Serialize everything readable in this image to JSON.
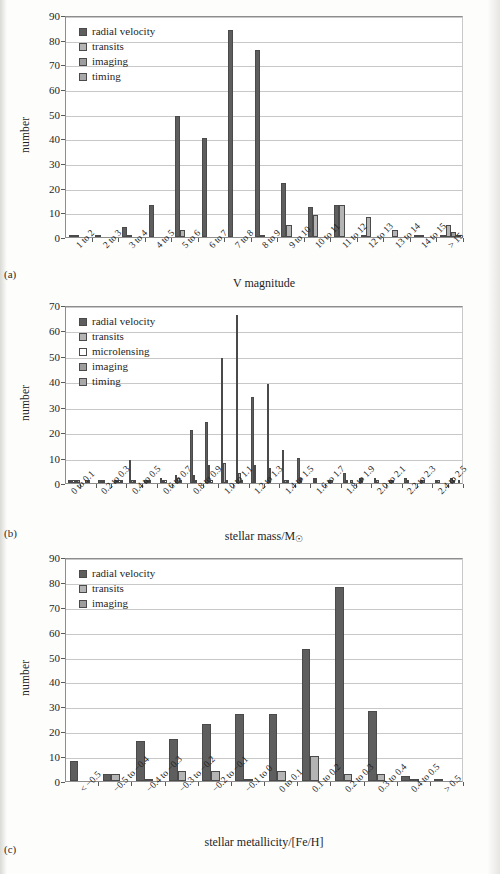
{
  "figure": {
    "panel_tags": [
      "(a)",
      "(b)",
      "(c)"
    ],
    "series_colors": {
      "radial velocity": "#5e5e5e",
      "transits": "#b4b4b4",
      "microlensing": "#ffffff",
      "imaging": "#9d9d9d",
      "timing": "#a8a8a8"
    }
  },
  "chart_data": [
    {
      "type": "bar",
      "panel": "(a)",
      "title": "",
      "xlabel": "V magnitude",
      "ylabel": "number",
      "ylim": [
        0,
        90
      ],
      "yticks": [
        0,
        10,
        20,
        30,
        40,
        50,
        60,
        70,
        80,
        90
      ],
      "grid": true,
      "legend_position": "top-left",
      "categories": [
        "1 to 2",
        "2 to 3",
        "3 to 4",
        "4 to 5",
        "5 to 6",
        "6 to 7",
        "7 to 8",
        "8 to 9",
        "9 to 10",
        "10 to 11",
        "11 to 12",
        "12 to 13",
        "13 to 14",
        "14 to 15",
        "> 15"
      ],
      "series": [
        {
          "name": "radial velocity",
          "values": [
            1,
            1,
            4,
            13,
            49,
            40,
            84,
            76,
            22,
            12,
            13,
            1,
            0,
            1,
            1
          ]
        },
        {
          "name": "transits",
          "values": [
            1,
            0,
            1,
            0,
            3,
            0,
            0,
            1,
            5,
            9,
            13,
            8,
            3,
            1,
            5
          ]
        },
        {
          "name": "imaging",
          "values": [
            0,
            0,
            0,
            0,
            0,
            0,
            0,
            0,
            0,
            0,
            0,
            0,
            0,
            0,
            2
          ]
        },
        {
          "name": "timing",
          "values": [
            0,
            0,
            0,
            0,
            0,
            0,
            0,
            0,
            0,
            0,
            0,
            0,
            0,
            0,
            1
          ]
        }
      ]
    },
    {
      "type": "bar",
      "panel": "(b)",
      "title": "",
      "xlabel": "stellar mass/M☉",
      "ylabel": "number",
      "ylim": [
        0,
        70
      ],
      "yticks": [
        0,
        10,
        20,
        30,
        40,
        50,
        60,
        70
      ],
      "grid": true,
      "legend_position": "top-left",
      "categories": [
        "0 to 0.1",
        "0.2 to 0.3",
        "0.4 to 0.5",
        "0.6 to 0.7",
        "0.8 to 0.9",
        "1.0 to 1.1",
        "1.2 to 1.3",
        "1.4 to 1.5",
        "1.6 to 1.7",
        "1.8 to 1.9",
        "2.0 to 2.1",
        "2.2 to 2.3",
        "2.4 to 2.5",
        "> 2.5"
      ],
      "bins": [
        "0 to 0.1",
        "0.1 to 0.2",
        "0.2 to 0.3",
        "0.3 to 0.4",
        "0.4 to 0.5",
        "0.5 to 0.6",
        "0.6 to 0.7",
        "0.7 to 0.8",
        "0.8 to 0.9",
        "0.9 to 1.0",
        "1.0 to 1.1",
        "1.1 to 1.2",
        "1.2 to 1.3",
        "1.3 to 1.4",
        "1.4 to 1.5",
        "1.5 to 1.6",
        "1.6 to 1.7",
        "1.7 to 1.8",
        "1.8 to 1.9",
        "1.9 to 2.0",
        "2.0 to 2.1",
        "2.1 to 2.2",
        "2.2 to 2.3",
        "2.3 to 2.4",
        "2.4 to 2.5",
        "> 2.5"
      ],
      "series": [
        {
          "name": "radial velocity",
          "values": [
            1,
            1,
            1,
            1,
            9,
            1,
            3,
            2,
            21,
            24,
            49,
            66,
            34,
            39,
            13,
            14,
            10,
            1,
            2,
            3,
            1,
            1,
            4,
            1,
            2,
            2,
            2,
            1,
            2,
            2,
            1,
            2
          ]
        },
        {
          "name": "transits",
          "values": [
            1,
            0,
            1,
            1,
            1,
            1,
            1,
            1,
            3,
            7,
            8,
            3,
            4,
            7,
            6,
            1,
            2,
            3,
            2,
            1,
            1,
            2,
            1,
            2,
            1,
            1,
            1,
            1,
            1,
            1,
            1,
            2
          ]
        },
        {
          "name": "microlensing",
          "values": [
            1,
            1,
            1,
            1,
            1,
            1,
            1,
            1,
            1,
            0,
            1,
            1,
            0,
            0,
            1,
            1,
            0,
            0,
            0,
            0,
            0,
            0,
            0,
            0,
            0,
            0,
            0,
            0,
            0,
            0,
            0,
            0
          ]
        },
        {
          "name": "imaging",
          "values": [
            1,
            0,
            0,
            1,
            0,
            1,
            0,
            0,
            0,
            0,
            0,
            0,
            0,
            0,
            0,
            0,
            1,
            0,
            0,
            1,
            0,
            0,
            0,
            0,
            0,
            0,
            0,
            0,
            0,
            0,
            0,
            1
          ]
        },
        {
          "name": "timing",
          "values": [
            1,
            0,
            0,
            0,
            0,
            0,
            0,
            0,
            0,
            0,
            0,
            0,
            0,
            0,
            0,
            0,
            0,
            0,
            0,
            0,
            0,
            0,
            0,
            0,
            0,
            0,
            0,
            0,
            0,
            0,
            0,
            0
          ]
        }
      ],
      "bin_values": {
        "radial velocity": [
          1,
          0,
          1,
          1,
          9,
          1,
          2,
          3,
          21,
          24,
          49,
          66,
          34,
          39,
          13,
          10,
          2,
          1,
          4,
          2,
          2,
          1,
          2,
          1,
          1,
          2
        ],
        "transits": [
          1,
          1,
          1,
          1,
          1,
          1,
          1,
          2,
          3,
          7,
          8,
          4,
          7,
          6,
          1,
          2,
          2,
          1,
          1,
          2,
          1,
          1,
          1,
          1,
          1,
          1
        ],
        "microlensing": [
          1,
          1,
          1,
          1,
          1,
          1,
          1,
          1,
          1,
          1,
          1,
          1,
          0,
          0,
          1,
          0,
          0,
          0,
          0,
          0,
          0,
          0,
          0,
          0,
          0,
          0
        ],
        "imaging": [
          1,
          0,
          0,
          1,
          0,
          0,
          0,
          0,
          0,
          0,
          0,
          0,
          0,
          0,
          0,
          0,
          0,
          0,
          1,
          0,
          0,
          0,
          0,
          0,
          0,
          1
        ],
        "timing": [
          1,
          0,
          0,
          0,
          0,
          0,
          0,
          0,
          0,
          0,
          0,
          0,
          0,
          0,
          0,
          0,
          0,
          0,
          0,
          0,
          0,
          0,
          0,
          0,
          0,
          0
        ]
      }
    },
    {
      "type": "bar",
      "panel": "(c)",
      "title": "",
      "xlabel": "stellar metallicity/[Fe/H]",
      "ylabel": "number",
      "ylim": [
        0,
        90
      ],
      "yticks": [
        0,
        10,
        20,
        30,
        40,
        50,
        60,
        70,
        80,
        90
      ],
      "grid": true,
      "legend_position": "top-left",
      "categories": [
        "< −0.5",
        "−0.5 to −0.4",
        "−0.4 to −0.3",
        "−0.3 to −0.2",
        "−0.2 to −0.1",
        "−0.1 to 0",
        "0 to 0.1",
        "0.1 to 0.2",
        "0.2 to 0.3",
        "0.3 to 0.4",
        "0.4 to 0.5",
        "> 0.5"
      ],
      "series": [
        {
          "name": "radial velocity",
          "values": [
            8,
            3,
            16,
            17,
            23,
            27,
            27,
            53,
            78,
            28,
            2,
            1
          ]
        },
        {
          "name": "transits",
          "values": [
            0,
            3,
            1,
            4,
            4,
            1,
            4,
            10,
            3,
            3,
            1,
            0
          ]
        },
        {
          "name": "imaging",
          "values": [
            0,
            0,
            0,
            0,
            0,
            0,
            0,
            0,
            0,
            0,
            0,
            0
          ]
        }
      ]
    }
  ]
}
